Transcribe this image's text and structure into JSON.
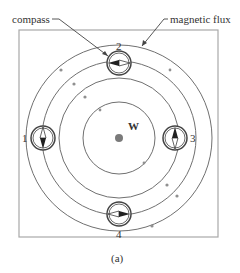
{
  "figure": {
    "caption": "(a)",
    "labels": {
      "compass": "compass",
      "magnetic_flux": "magnetic flux",
      "wire": "W"
    },
    "compasses": [
      {
        "id": "1",
        "label": "1",
        "position": "left",
        "needle": "vertical"
      },
      {
        "id": "2",
        "label": "2",
        "position": "top",
        "needle": "horizontal"
      },
      {
        "id": "3",
        "label": "3",
        "position": "right",
        "needle": "vertical"
      },
      {
        "id": "4",
        "label": "4",
        "position": "bottom",
        "needle": "horizontal"
      }
    ],
    "flux_rings": 4,
    "colors": {
      "line": "#707070",
      "wire": "#808080",
      "frame": "#a0a0a0"
    }
  }
}
